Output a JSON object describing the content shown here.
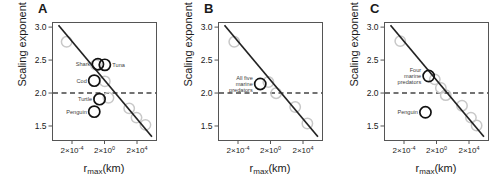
{
  "figure": {
    "axis": {
      "ylabel": "Scaling exponent (β)",
      "xlabel_base": "r",
      "xlabel_sub": "max",
      "xlabel_unit": "(km)",
      "yticks": [
        "3.0",
        "2.5",
        "2.0",
        "1.5"
      ],
      "ytick_values": [
        3.0,
        2.5,
        2.0,
        1.5
      ],
      "ylim": [
        1.28,
        3.07
      ],
      "xticks": [
        {
          "mantissa": "2×10",
          "exponent": "-4"
        },
        {
          "mantissa": "2×10",
          "exponent": "0"
        },
        {
          "mantissa": "2×10",
          "exponent": "4"
        }
      ],
      "xtick_values": [
        -4,
        0,
        4
      ],
      "xlim": [
        -6.4,
        6.4
      ],
      "reference_line_y": 2.0,
      "grid": false
    },
    "colors": {
      "axis": "#555555",
      "text": "#1a1a1a",
      "trend_line": "#222222",
      "highlight_marker": "#111111",
      "faint_marker": "#c8c8c8",
      "dashed_line": "#444444",
      "background": "#ffffff"
    },
    "panels": [
      {
        "letter": "A",
        "trend": {
          "x1": -5.6,
          "y1": 3.02,
          "x2": 5.9,
          "y2": 1.33
        },
        "faint_points": [
          {
            "x": -4.6,
            "y": 2.77
          },
          {
            "x": -1.0,
            "y": 2.42
          },
          {
            "x": 0.1,
            "y": 2.17
          },
          {
            "x": 0.55,
            "y": 1.92
          },
          {
            "x": 3.1,
            "y": 1.76
          },
          {
            "x": 4.0,
            "y": 1.62
          },
          {
            "x": 5.1,
            "y": 1.51
          }
        ],
        "highlight_points": [
          {
            "x": -0.75,
            "y": 2.43,
            "label": "Shark",
            "label_side": "left"
          },
          {
            "x": 0.1,
            "y": 2.42,
            "label": "Tuna",
            "label_side": "right"
          },
          {
            "x": -1.2,
            "y": 2.18,
            "label": "Cod",
            "label_side": "left"
          },
          {
            "x": -0.55,
            "y": 1.9,
            "label": "Turtle",
            "label_side": "left"
          },
          {
            "x": -1.2,
            "y": 1.71,
            "label": "Penguin",
            "label_side": "left"
          }
        ]
      },
      {
        "letter": "B",
        "trend": {
          "x1": -5.6,
          "y1": 3.02,
          "x2": 5.9,
          "y2": 1.33
        },
        "faint_points": [
          {
            "x": -4.4,
            "y": 2.77
          },
          {
            "x": -0.2,
            "y": 2.16
          },
          {
            "x": 0.75,
            "y": 1.99
          },
          {
            "x": 3.1,
            "y": 1.78
          },
          {
            "x": 4.6,
            "y": 1.53
          }
        ],
        "highlight_points": [
          {
            "x": -1.2,
            "y": 2.13,
            "label": "All five\nmarine\npredators",
            "label_side": "left"
          }
        ]
      },
      {
        "letter": "C",
        "trend": {
          "x1": -5.6,
          "y1": 3.02,
          "x2": 5.9,
          "y2": 1.33
        },
        "faint_points": [
          {
            "x": -4.4,
            "y": 2.78
          },
          {
            "x": -0.15,
            "y": 2.2
          },
          {
            "x": 0.6,
            "y": 2.07
          },
          {
            "x": 1.2,
            "y": 1.96
          },
          {
            "x": 3.2,
            "y": 1.8
          },
          {
            "x": 4.3,
            "y": 1.62
          },
          {
            "x": 5.0,
            "y": 1.5
          }
        ],
        "highlight_points": [
          {
            "x": -0.9,
            "y": 2.25,
            "label": "Four\nmarine\npredators",
            "label_side": "left"
          },
          {
            "x": -1.3,
            "y": 1.7,
            "label": "Penguin",
            "label_side": "left"
          }
        ]
      }
    ]
  },
  "chart_data": {
    "type": "scatter",
    "title": "",
    "xlabel": "r_max (km)",
    "ylabel": "Scaling exponent (β)",
    "xlim": [
      -6.4,
      6.4
    ],
    "ylim": [
      1.28,
      3.07
    ],
    "x_is_log10": true,
    "grid": false,
    "legend": "none",
    "annotations": [
      "Shark",
      "Tuna",
      "Cod",
      "Turtle",
      "Penguin",
      "All five marine predators",
      "Four marine predators"
    ],
    "reference_lines": [
      {
        "type": "horizontal",
        "y": 2.0,
        "style": "dashed"
      }
    ],
    "panels": [
      {
        "panel": "A",
        "trend_line": {
          "x": [
            -5.6,
            5.9
          ],
          "y": [
            3.02,
            1.33
          ]
        },
        "series": [
          {
            "name": "faint (other taxa)",
            "color": "#c8c8c8",
            "x": [
              -4.6,
              -1.0,
              0.1,
              0.55,
              3.1,
              4.0,
              5.1
            ],
            "y": [
              2.77,
              2.42,
              2.17,
              1.92,
              1.76,
              1.62,
              1.51
            ]
          },
          {
            "name": "highlighted marine predators",
            "color": "#111111",
            "labels": [
              "Shark",
              "Tuna",
              "Cod",
              "Turtle",
              "Penguin"
            ],
            "x": [
              -0.75,
              0.1,
              -1.2,
              -0.55,
              -1.2
            ],
            "y": [
              2.43,
              2.42,
              2.18,
              1.9,
              1.71
            ]
          }
        ]
      },
      {
        "panel": "B",
        "trend_line": {
          "x": [
            -5.6,
            5.9
          ],
          "y": [
            3.02,
            1.33
          ]
        },
        "series": [
          {
            "name": "faint (other taxa)",
            "color": "#c8c8c8",
            "x": [
              -4.4,
              -0.2,
              0.75,
              3.1,
              4.6
            ],
            "y": [
              2.77,
              2.16,
              1.99,
              1.78,
              1.53
            ]
          },
          {
            "name": "All five marine predators",
            "color": "#111111",
            "labels": [
              "All five marine predators"
            ],
            "x": [
              -1.2
            ],
            "y": [
              2.13
            ]
          }
        ]
      },
      {
        "panel": "C",
        "trend_line": {
          "x": [
            -5.6,
            5.9
          ],
          "y": [
            3.02,
            1.33
          ]
        },
        "series": [
          {
            "name": "faint (other taxa)",
            "color": "#c8c8c8",
            "x": [
              -4.4,
              -0.15,
              0.6,
              1.2,
              3.2,
              4.3,
              5.0
            ],
            "y": [
              2.78,
              2.2,
              2.07,
              1.96,
              1.8,
              1.62,
              1.5
            ]
          },
          {
            "name": "highlighted groups",
            "color": "#111111",
            "labels": [
              "Four marine predators",
              "Penguin"
            ],
            "x": [
              -0.9,
              -1.3
            ],
            "y": [
              2.25,
              1.7
            ]
          }
        ]
      }
    ]
  }
}
